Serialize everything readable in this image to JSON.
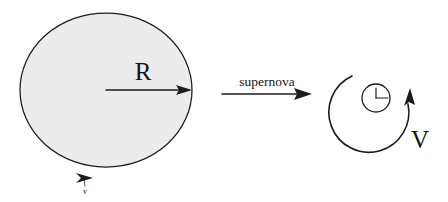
{
  "figure": {
    "background_color": "#ffffff",
    "ink_color": "#1c1c1c",
    "star_fill_color": "#ececec",
    "labels": {
      "radius": "R",
      "surface_velocity": "v",
      "process": "supernova",
      "ejecta_velocity": "V"
    },
    "left_panel": {
      "name": "progenitor-star",
      "shape": "filled-circle",
      "center_x": 106,
      "center_y": 90,
      "radius_px": 76,
      "radius_label": "R",
      "radius_arrow": {
        "from_x": 106,
        "from_y": 90,
        "to_x": 191,
        "to_y": 90
      },
      "surface_velocity_label": "v",
      "surface_velocity_arrow": {
        "x": 84,
        "y": 177,
        "direction": "right"
      }
    },
    "middle_panel": {
      "name": "supernova-transition",
      "label": "supernova",
      "arrow": {
        "from_x": 222,
        "from_y": 94,
        "to_x": 311,
        "to_y": 94
      }
    },
    "right_panel": {
      "name": "remnant-and-ejecta",
      "compact_object": {
        "center_x": 376,
        "center_y": 98,
        "radius_px": 14,
        "has_radius_line": true
      },
      "ejecta_shell": {
        "center_x": 377,
        "center_y": 113,
        "radius_px": 40,
        "open_sector": "upper-right",
        "arrow_direction": "counterclockwise-up"
      },
      "velocity_label": "V"
    }
  }
}
